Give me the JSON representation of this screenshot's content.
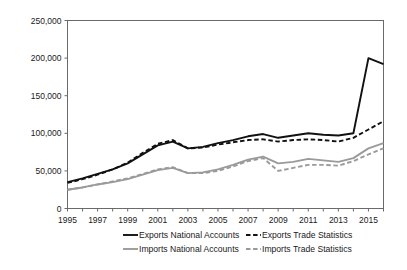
{
  "chart_data": {
    "type": "line",
    "title": "",
    "xlabel": "",
    "ylabel": "",
    "xlim": [
      1995,
      2016
    ],
    "ylim": [
      0,
      250000
    ],
    "grid": false,
    "legend_position": "bottom",
    "y_ticks": [
      0,
      50000,
      100000,
      150000,
      200000,
      250000
    ],
    "y_tick_labels": [
      "0",
      "50,000",
      "100,000",
      "150,000",
      "200,000",
      "250,000"
    ],
    "x_ticks": [
      1995,
      1997,
      1999,
      2001,
      2003,
      2005,
      2007,
      2009,
      2011,
      2013,
      2015
    ],
    "x_tick_labels": [
      "1995",
      "1997",
      "1999",
      "2001",
      "2003",
      "2005",
      "2007",
      "2009",
      "2011",
      "2013",
      "2015"
    ],
    "x": [
      1995,
      1996,
      1997,
      1998,
      1999,
      2000,
      2001,
      2002,
      2003,
      2004,
      2005,
      2006,
      2007,
      2008,
      2009,
      2010,
      2011,
      2012,
      2013,
      2014,
      2015,
      2016
    ],
    "series": [
      {
        "name": "Exports National Accounts",
        "color": "#111111",
        "style": "solid",
        "width": 1.9,
        "values": [
          35000,
          40000,
          46000,
          52000,
          60000,
          72000,
          84000,
          89000,
          80000,
          82000,
          87000,
          91000,
          96000,
          99000,
          94000,
          97000,
          100000,
          98000,
          97000,
          100000,
          200000,
          192000
        ]
      },
      {
        "name": "Exports Trade Statistics",
        "color": "#111111",
        "style": "dashed",
        "width": 1.9,
        "values": [
          34000,
          39000,
          45000,
          52000,
          61000,
          74000,
          86000,
          91000,
          80000,
          81000,
          85000,
          88000,
          91000,
          92000,
          89000,
          91000,
          92000,
          91000,
          89000,
          94000,
          105000,
          116000
        ]
      },
      {
        "name": "Imports National Accounts",
        "color": "#9a9a9a",
        "style": "solid",
        "width": 1.9,
        "values": [
          25000,
          28000,
          32000,
          35000,
          39000,
          45000,
          51000,
          54000,
          47000,
          48000,
          52000,
          58000,
          65000,
          69000,
          60000,
          62000,
          66000,
          64000,
          62000,
          67000,
          80000,
          87000
        ]
      },
      {
        "name": "Imports Trade Statistics",
        "color": "#9a9a9a",
        "style": "dashed",
        "width": 1.9,
        "values": [
          25000,
          28000,
          32000,
          36000,
          40000,
          46000,
          52000,
          55000,
          47000,
          47000,
          50000,
          56000,
          63000,
          67000,
          50000,
          54000,
          58000,
          58000,
          57000,
          63000,
          72000,
          80000
        ]
      }
    ]
  },
  "legend": {
    "items": [
      {
        "label": "Exports National Accounts",
        "color": "#111111",
        "style": "solid"
      },
      {
        "label": "Exports Trade Statistics",
        "color": "#111111",
        "style": "dashed"
      },
      {
        "label": "Imports National Accounts",
        "color": "#9a9a9a",
        "style": "solid"
      },
      {
        "label": "Imports Trade Statistics",
        "color": "#9a9a9a",
        "style": "dashed"
      }
    ]
  }
}
